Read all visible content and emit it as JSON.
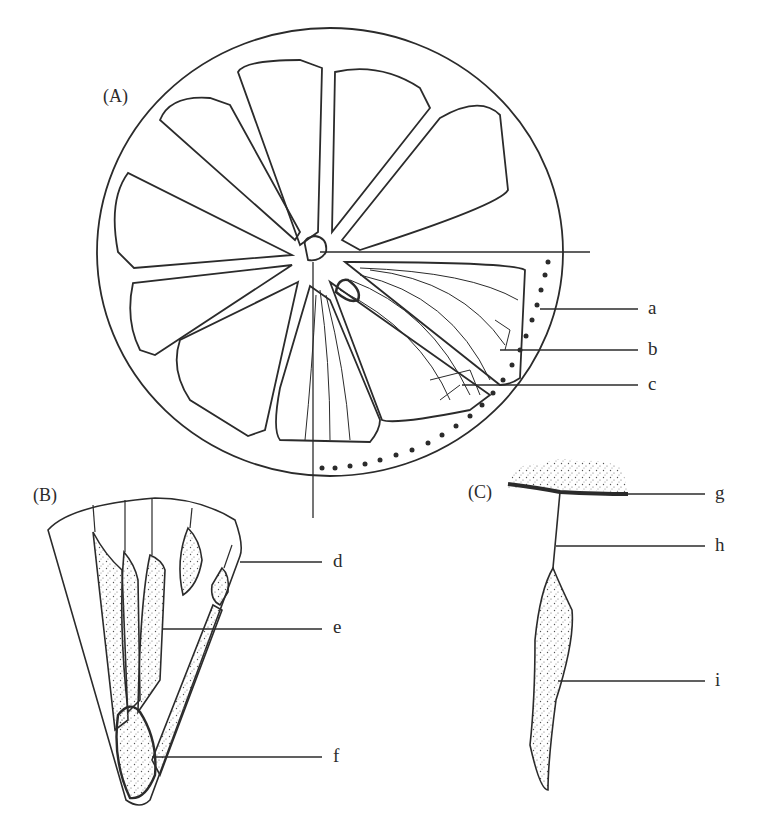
{
  "figure": {
    "panels": [
      {
        "id": "A",
        "label": "(A)",
        "description": "Transverse section of citrus fruit showing 10 segments radiating from a central axis"
      },
      {
        "id": "B",
        "label": "(B)",
        "description": "Single segment with juice vesicles"
      },
      {
        "id": "C",
        "label": "(C)",
        "description": "Single juice vesicle attached to segment wall by a stalk"
      }
    ],
    "callouts": [
      {
        "letter": "a",
        "panel": "A",
        "x": 648,
        "y": 309
      },
      {
        "letter": "b",
        "panel": "A",
        "x": 648,
        "y": 350
      },
      {
        "letter": "c",
        "panel": "A",
        "x": 648,
        "y": 385
      },
      {
        "letter": "d",
        "panel": "B",
        "x": 333,
        "y": 562
      },
      {
        "letter": "e",
        "panel": "B",
        "x": 333,
        "y": 629
      },
      {
        "letter": "f",
        "panel": "B",
        "x": 333,
        "y": 757
      },
      {
        "letter": "g",
        "panel": "C",
        "x": 715,
        "y": 494
      },
      {
        "letter": "h",
        "panel": "C",
        "x": 715,
        "y": 546
      },
      {
        "letter": "i",
        "panel": "C",
        "x": 715,
        "y": 681
      }
    ],
    "colors": {
      "ink": "#2b2b2b",
      "background": "#ffffff",
      "stipple": "#555555"
    }
  }
}
